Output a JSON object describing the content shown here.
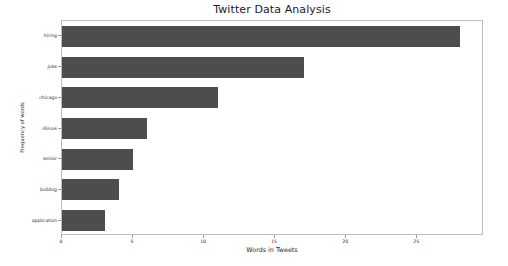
{
  "chart_data": {
    "type": "bar",
    "orientation": "horizontal",
    "title": "Twitter Data Analysis",
    "xlabel": "Words in Tweets",
    "ylabel": "Frequency of words",
    "categories": [
      "hiring",
      "jobs",
      "chicago",
      "illinois",
      "senior",
      "bulldog",
      "application"
    ],
    "values": [
      28,
      17,
      11,
      6,
      5,
      4,
      3
    ],
    "xticks": [
      0,
      5,
      10,
      15,
      20,
      25
    ],
    "xlim": [
      0,
      29.7
    ],
    "grid": false,
    "legend": false,
    "bar_color": "#4d4d4d",
    "background_color": "#ffffff",
    "axes_edge_color": "#bdbdbd"
  }
}
